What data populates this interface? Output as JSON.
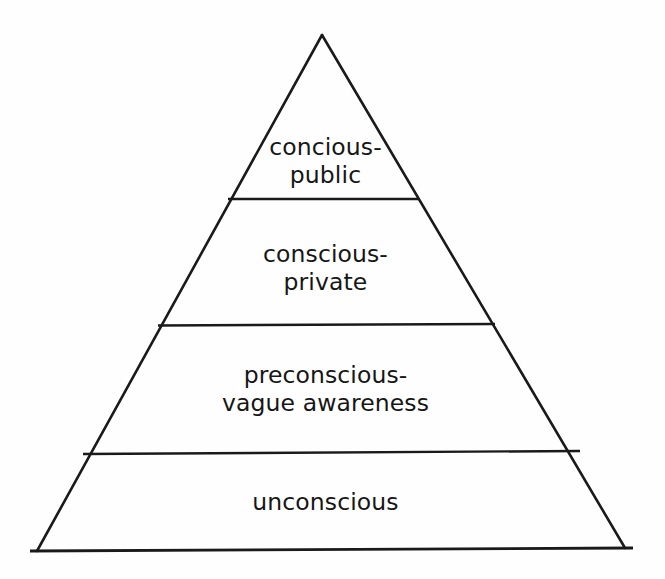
{
  "diagram": {
    "type": "pyramid",
    "title": "",
    "background_color": "#fefefe",
    "stroke_color": "#1a1a1a",
    "text_color": "#161616",
    "apex": {
      "x": 322,
      "y": 35
    },
    "base_left": {
      "x": 37,
      "y": 551
    },
    "base_right": {
      "x": 625,
      "y": 548
    },
    "levels": [
      {
        "id": "conscious-public",
        "order": 1,
        "line1": "concious-",
        "line2": "public",
        "divider_y": 199,
        "divider_x1": 228,
        "divider_x2": 419
      },
      {
        "id": "conscious-private",
        "order": 2,
        "line1": "conscious-",
        "line2": "private",
        "divider_y": 325,
        "divider_x1": 158,
        "divider_x2": 495
      },
      {
        "id": "preconscious",
        "order": 3,
        "line1": "preconscious-",
        "line2": "vague awareness",
        "divider_y": 453,
        "divider_x1": 83,
        "divider_x2": 580
      },
      {
        "id": "unconscious",
        "order": 4,
        "line1": "unconscious",
        "line2": "",
        "divider_y": 549,
        "divider_x1": 30,
        "divider_x2": 633
      }
    ]
  }
}
